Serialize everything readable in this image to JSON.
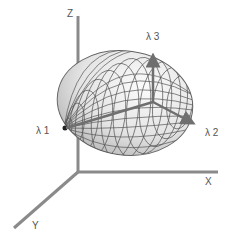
{
  "diagram": {
    "type": "3d-ellipsoid-eigenvectors",
    "axes": {
      "x_label": "X",
      "y_label": "Y",
      "z_label": "Z"
    },
    "eigenvectors": {
      "lambda1_label": "λ 1",
      "lambda2_label": "λ 2",
      "lambda3_label": "λ 3"
    },
    "colors": {
      "axis": "#8a8a8a",
      "arrow": "#6f6f6f",
      "mesh_line": "#555555",
      "surface_light": "#f2f2f2",
      "surface_dark": "#a8a8a8",
      "label": "#555555"
    }
  }
}
